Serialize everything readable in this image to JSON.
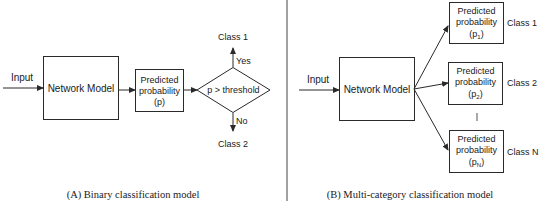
{
  "panel_a": {
    "input_label": "Input",
    "network_model_label": "Network Model",
    "predicted_box": {
      "line1": "Predicted",
      "line2": "probability",
      "line3": "(p)"
    },
    "decision_label": "p > threshold",
    "yes_label": "Yes",
    "no_label": "No",
    "class_1_label": "Class 1",
    "class_2_label": "Class 2",
    "caption": "(A) Binary classification model"
  },
  "panel_b": {
    "input_label": "Input",
    "network_model_label": "Network Model",
    "outputs": [
      {
        "line1": "Predicted",
        "line2": "probability",
        "symbol": "p",
        "subscript": "1",
        "class_label": "Class 1"
      },
      {
        "line1": "Predicted",
        "line2": "probability",
        "symbol": "p",
        "subscript": "2",
        "class_label": "Class 2"
      },
      {
        "line1": "Predicted",
        "line2": "probability",
        "symbol": "p",
        "subscript": "N",
        "class_label": "Class N"
      }
    ],
    "caption": "(B) Multi-category classification model"
  },
  "colors": {
    "stroke": "#2a2a2a",
    "text": "#1a1a1a",
    "background": "#ffffff"
  }
}
